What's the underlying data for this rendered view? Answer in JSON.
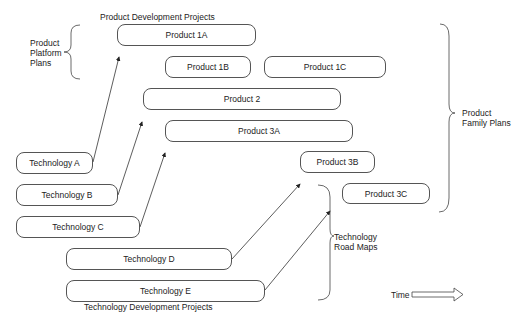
{
  "title_top": "Product Development Projects",
  "title_bottom": "Technology Development Projects",
  "products": [
    {
      "id": "1A",
      "label": "Product 1A"
    },
    {
      "id": "1B",
      "label": "Product 1B"
    },
    {
      "id": "1C",
      "label": "Product 1C"
    },
    {
      "id": "2",
      "label": "Product 2"
    },
    {
      "id": "3A",
      "label": "Product 3A"
    },
    {
      "id": "3B",
      "label": "Product 3B"
    },
    {
      "id": "3C",
      "label": "Product 3C"
    }
  ],
  "technologies": [
    {
      "id": "A",
      "label": "Technology A"
    },
    {
      "id": "B",
      "label": "Technology B"
    },
    {
      "id": "C",
      "label": "Technology C"
    },
    {
      "id": "D",
      "label": "Technology D"
    },
    {
      "id": "E",
      "label": "Technology E"
    }
  ],
  "braces": {
    "platform": {
      "line1": "Product",
      "line2": "Platform",
      "line3": "Plans"
    },
    "family": {
      "line1": "Product",
      "line2": "Family Plans"
    },
    "roadmaps": {
      "line1": "Technology",
      "line2": "Road Maps"
    }
  },
  "time_label": "Time",
  "arrows": [
    {
      "from": "Technology A",
      "to": "Product 1A"
    },
    {
      "from": "Technology B",
      "to": "Product 2"
    },
    {
      "from": "Technology C",
      "to": "Product 3A"
    },
    {
      "from": "Technology D",
      "to": "Product 3B"
    },
    {
      "from": "Technology E",
      "to": "Product 3C"
    }
  ]
}
